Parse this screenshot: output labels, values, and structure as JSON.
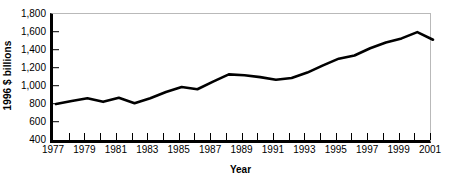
{
  "chart_data": {
    "type": "line",
    "title": "",
    "subtitle": "",
    "xlabel": "Year",
    "ylabel": "1996 $ billions",
    "xlim": [
      1977,
      2001
    ],
    "ylim": [
      400,
      1800
    ],
    "grid": false,
    "legend": false,
    "legend_position": "none",
    "line_color": "#000000",
    "frame_color": "#b9b9b9",
    "axis_color": "#000000",
    "x": [
      1977,
      1978,
      1979,
      1980,
      1981,
      1982,
      1983,
      1984,
      1985,
      1986,
      1987,
      1988,
      1989,
      1990,
      1991,
      1992,
      1993,
      1994,
      1995,
      1996,
      1997,
      1998,
      1999,
      2000,
      2001
    ],
    "values": [
      810,
      845,
      875,
      835,
      880,
      820,
      875,
      945,
      1000,
      975,
      1060,
      1140,
      1130,
      1110,
      1080,
      1100,
      1160,
      1240,
      1315,
      1350,
      1430,
      1495,
      1540,
      1610,
      1525
    ],
    "y_ticks": [
      400,
      600,
      800,
      1000,
      1200,
      1400,
      1600,
      1800
    ],
    "y_tick_labels": [
      "400",
      "600",
      "800",
      "1,000",
      "1,200",
      "1,400",
      "1,600",
      "1,800"
    ],
    "x_ticks": [
      1977,
      1978,
      1979,
      1980,
      1981,
      1982,
      1983,
      1984,
      1985,
      1986,
      1987,
      1988,
      1989,
      1990,
      1991,
      1992,
      1993,
      1994,
      1995,
      1996,
      1997,
      1998,
      1999,
      2000,
      2001
    ],
    "x_tick_labels_shown": [
      1977,
      1979,
      1981,
      1983,
      1985,
      1987,
      1989,
      1991,
      1993,
      1995,
      1997,
      1999,
      2001
    ],
    "x_tick_label_texts": [
      "1977",
      "1979",
      "1981",
      "1983",
      "1985",
      "1987",
      "1989",
      "1991",
      "1993",
      "1995",
      "1997",
      "1999",
      "2001"
    ]
  },
  "axes": {
    "y_title": "1996 $ billions",
    "x_title": "Year"
  }
}
